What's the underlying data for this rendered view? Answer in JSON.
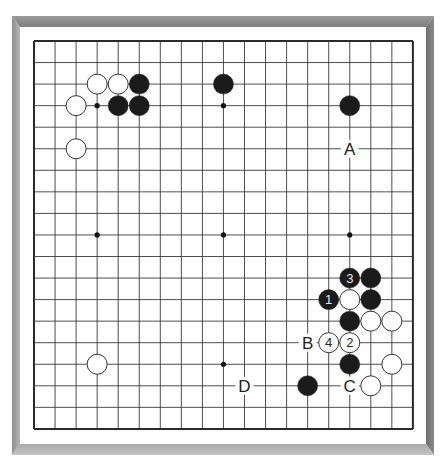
{
  "board": {
    "size": 19,
    "origin_x": 34,
    "origin_y": 41,
    "spacing_x": 21.05,
    "spacing_y": 21.55,
    "stone_radius": 10,
    "colors": {
      "line": "#3a3a3a",
      "border_line": "#2a2a2a",
      "black_stone": "#1b1b1b",
      "white_stone": "#ffffff",
      "white_stone_outline": "#333333",
      "number_on_black": "#e6e6e6",
      "number_on_white": "#222222",
      "label": "#222222",
      "frame_top": "#858585",
      "frame_left": "#a0a0a0",
      "frame_right": "#787878",
      "frame_bottom": "#b8b8b8"
    },
    "star_points": [
      [
        3,
        3
      ],
      [
        9,
        3
      ],
      [
        15,
        3
      ],
      [
        3,
        9
      ],
      [
        9,
        9
      ],
      [
        15,
        9
      ],
      [
        3,
        15
      ],
      [
        9,
        15
      ],
      [
        15,
        15
      ]
    ],
    "stones": [
      {
        "color": "white",
        "col": 3,
        "row": 2,
        "label": ""
      },
      {
        "color": "white",
        "col": 4,
        "row": 2,
        "label": ""
      },
      {
        "color": "black",
        "col": 5,
        "row": 2,
        "label": ""
      },
      {
        "color": "white",
        "col": 2,
        "row": 3,
        "label": ""
      },
      {
        "color": "black",
        "col": 4,
        "row": 3,
        "label": ""
      },
      {
        "color": "black",
        "col": 5,
        "row": 3,
        "label": ""
      },
      {
        "color": "white",
        "col": 2,
        "row": 5,
        "label": ""
      },
      {
        "color": "black",
        "col": 9,
        "row": 2,
        "label": ""
      },
      {
        "color": "black",
        "col": 15,
        "row": 3,
        "label": ""
      },
      {
        "color": "black",
        "col": 15,
        "row": 11,
        "label": "3"
      },
      {
        "color": "black",
        "col": 16,
        "row": 11,
        "label": ""
      },
      {
        "color": "black",
        "col": 14,
        "row": 12,
        "label": "1"
      },
      {
        "color": "white",
        "col": 15,
        "row": 12,
        "label": ""
      },
      {
        "color": "black",
        "col": 16,
        "row": 12,
        "label": ""
      },
      {
        "color": "black",
        "col": 15,
        "row": 13,
        "label": ""
      },
      {
        "color": "white",
        "col": 16,
        "row": 13,
        "label": ""
      },
      {
        "color": "white",
        "col": 17,
        "row": 13,
        "label": ""
      },
      {
        "color": "white",
        "col": 14,
        "row": 14,
        "label": "4"
      },
      {
        "color": "white",
        "col": 15,
        "row": 14,
        "label": "2"
      },
      {
        "color": "black",
        "col": 15,
        "row": 15,
        "label": ""
      },
      {
        "color": "white",
        "col": 17,
        "row": 15,
        "label": ""
      },
      {
        "color": "white",
        "col": 3,
        "row": 15,
        "label": ""
      },
      {
        "color": "black",
        "col": 13,
        "row": 16,
        "label": ""
      },
      {
        "color": "white",
        "col": 16,
        "row": 16,
        "label": ""
      }
    ],
    "markers": [
      {
        "text": "A",
        "col": 15,
        "row": 5
      },
      {
        "text": "B",
        "col": 13,
        "row": 14
      },
      {
        "text": "C",
        "col": 15,
        "row": 16
      },
      {
        "text": "D",
        "col": 10,
        "row": 16
      }
    ]
  }
}
